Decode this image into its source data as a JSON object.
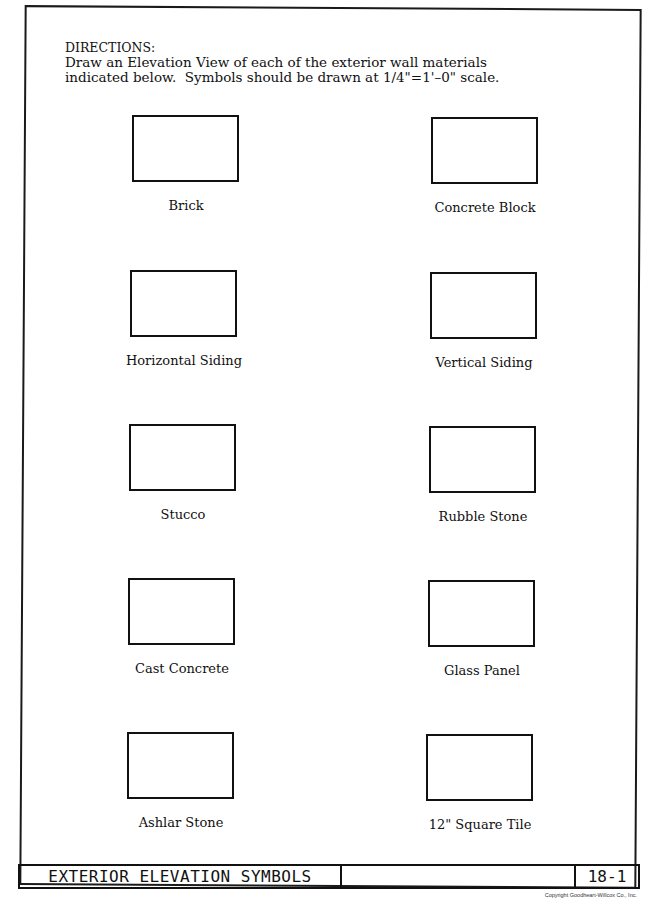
{
  "worksheet": {
    "directions": {
      "title": "DIRECTIONS:",
      "lines": [
        "Draw an Elevation View of each of the exterior wall materials",
        "indicated below.  Symbols should be drawn at 1/4\"=1'–0\" scale."
      ]
    },
    "symbols": [
      {
        "label": "Brick"
      },
      {
        "label": "Concrete Block"
      },
      {
        "label": "Horizontal Siding"
      },
      {
        "label": "Vertical Siding"
      },
      {
        "label": "Stucco"
      },
      {
        "label": "Rubble Stone"
      },
      {
        "label": "Cast Concrete"
      },
      {
        "label": "Glass Panel"
      },
      {
        "label": "Ashlar Stone"
      },
      {
        "label": "12\" Square Tile"
      }
    ]
  },
  "title_block": {
    "title": "EXTERIOR ELEVATION SYMBOLS",
    "blank": "",
    "sheet_number": "18-1"
  },
  "copyright": "Copyright Goodheart-Willcox Co., Inc."
}
